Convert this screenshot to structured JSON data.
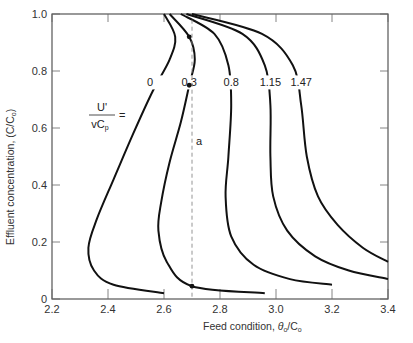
{
  "chart_data": {
    "type": "line",
    "title": "",
    "xlabel": "Feed condition, θo/Co",
    "ylabel": "Effluent concentration, (C/Co)",
    "xlim": [
      2.2,
      3.4
    ],
    "ylim": [
      0,
      1.0
    ],
    "xticks": [
      "2.2",
      "2.4",
      "2.6",
      "2.8",
      "3.0",
      "3.2",
      "3.4"
    ],
    "yticks": [
      "0",
      "0.2",
      "0.4",
      "0.6",
      "0.8",
      "1.0"
    ],
    "grid": false,
    "parameter_label": {
      "numerator": "U'",
      "denominator": "vCp",
      "eq": "="
    },
    "series": [
      {
        "name": "0",
        "points": [
          [
            2.6,
            1.0
          ],
          [
            2.64,
            0.92
          ],
          [
            2.62,
            0.84
          ],
          [
            2.56,
            0.73
          ],
          [
            2.49,
            0.58
          ],
          [
            2.42,
            0.42
          ],
          [
            2.36,
            0.28
          ],
          [
            2.33,
            0.18
          ],
          [
            2.35,
            0.1
          ],
          [
            2.42,
            0.05
          ],
          [
            2.6,
            0.02
          ]
        ]
      },
      {
        "name": "0.3",
        "points": [
          [
            2.62,
            1.0
          ],
          [
            2.69,
            0.92
          ],
          [
            2.71,
            0.84
          ],
          [
            2.69,
            0.75
          ],
          [
            2.66,
            0.62
          ],
          [
            2.62,
            0.48
          ],
          [
            2.59,
            0.34
          ],
          [
            2.58,
            0.24
          ],
          [
            2.61,
            0.13
          ],
          [
            2.7,
            0.045
          ],
          [
            2.96,
            0.02
          ]
        ]
      },
      {
        "name": "0.8",
        "points": [
          [
            2.66,
            1.0
          ],
          [
            2.78,
            0.93
          ],
          [
            2.83,
            0.82
          ],
          [
            2.84,
            0.68
          ],
          [
            2.83,
            0.5
          ],
          [
            2.82,
            0.36
          ],
          [
            2.84,
            0.22
          ],
          [
            2.92,
            0.12
          ],
          [
            3.05,
            0.07
          ],
          [
            3.2,
            0.05
          ]
        ]
      },
      {
        "name": "1.15",
        "points": [
          [
            2.68,
            1.0
          ],
          [
            2.88,
            0.93
          ],
          [
            2.96,
            0.82
          ],
          [
            2.98,
            0.68
          ],
          [
            2.98,
            0.5
          ],
          [
            2.99,
            0.36
          ],
          [
            3.04,
            0.24
          ],
          [
            3.14,
            0.15
          ],
          [
            3.26,
            0.1
          ],
          [
            3.4,
            0.07
          ]
        ]
      },
      {
        "name": "1.47",
        "points": [
          [
            2.7,
            1.0
          ],
          [
            2.95,
            0.93
          ],
          [
            3.06,
            0.82
          ],
          [
            3.09,
            0.68
          ],
          [
            3.11,
            0.5
          ],
          [
            3.15,
            0.36
          ],
          [
            3.22,
            0.26
          ],
          [
            3.31,
            0.18
          ],
          [
            3.4,
            0.13
          ]
        ]
      }
    ],
    "annotations": [
      {
        "text": "a",
        "type": "vertical-dashed-line",
        "x": 2.7
      },
      {
        "type": "marker",
        "x": 2.69,
        "y": 0.92
      },
      {
        "type": "marker",
        "x": 2.69,
        "y": 0.75
      },
      {
        "type": "marker",
        "x": 2.7,
        "y": 0.045
      }
    ]
  }
}
